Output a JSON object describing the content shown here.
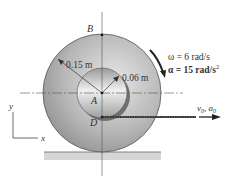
{
  "diagram": {
    "points": {
      "top": "B",
      "center": "A",
      "contact": "D"
    },
    "outer_radius_label": "0.15 m",
    "inner_radius_label": "0.06 m",
    "omega_label": "ω = 6 rad/s",
    "alpha_label": "α = 15 rad/s",
    "alpha_exp": "2",
    "cable_label": "v",
    "cable_sub0": "0",
    "cable_label2": ", a",
    "cable_sub1": "0",
    "axis_y": "y",
    "axis_x": "x",
    "colors": {
      "outer_disk": "#a9a9a9",
      "inner_disk": "#c8c8c8",
      "ground": "#d6d6d6",
      "line": "#333333"
    }
  }
}
